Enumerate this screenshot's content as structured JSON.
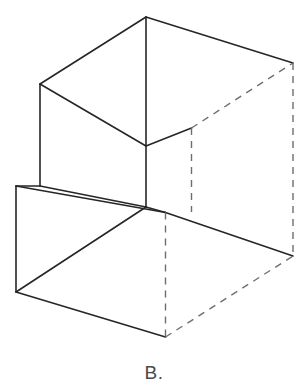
{
  "figure": {
    "caption": "B.",
    "label_letter": "B",
    "type": "isometric-wireframe",
    "canvas": {
      "width": 308,
      "height": 392,
      "background": "#ffffff"
    },
    "style": {
      "visible_edge_color": "#262626",
      "hidden_edge_color": "#6e6e6e",
      "visible_edge_width": 1.6,
      "hidden_edge_width": 1.4,
      "hidden_dash_pattern": "7 6"
    },
    "vertices": {
      "top_apex": [
        146,
        17
      ],
      "top_left": [
        40,
        84
      ],
      "top_right": [
        293,
        63
      ],
      "upper_front_right": [
        191,
        128
      ],
      "upper_front_center": [
        146,
        207
      ],
      "upper_left_lower": [
        40,
        186
      ],
      "lower_left_top": [
        16,
        186
      ],
      "lower_left_bottom": [
        16,
        292
      ],
      "lower_front_bottom": [
        165,
        337
      ],
      "lower_front_top": [
        165,
        212
      ],
      "lower_right_bottom": [
        293,
        256
      ],
      "step_left": [
        40,
        186
      ],
      "step_mid": [
        146,
        207
      ]
    },
    "edges_visible": [
      {
        "name": "top-face-left-back",
        "from": [
          146,
          17
        ],
        "to": [
          40,
          84
        ]
      },
      {
        "name": "top-face-right-back",
        "from": [
          146,
          17
        ],
        "to": [
          293,
          63
        ]
      },
      {
        "name": "top-face-front-left",
        "from": [
          40,
          84
        ],
        "to": [
          146,
          146
        ]
      },
      {
        "name": "top-face-front-right",
        "from": [
          146,
          146
        ],
        "to": [
          191,
          128
        ]
      },
      {
        "name": "center-vertical",
        "from": [
          146,
          17
        ],
        "to": [
          146,
          207
        ]
      },
      {
        "name": "upper-left-vertical",
        "from": [
          40,
          84
        ],
        "to": [
          40,
          186
        ]
      },
      {
        "name": "step-top-edge",
        "from": [
          40,
          186
        ],
        "to": [
          146,
          207
        ]
      },
      {
        "name": "step-front-edge",
        "from": [
          146,
          207
        ],
        "to": [
          165,
          212
        ]
      },
      {
        "name": "step-left-top",
        "from": [
          16,
          186
        ],
        "to": [
          40,
          186
        ]
      },
      {
        "name": "lower-top-left-edge",
        "from": [
          16,
          186
        ],
        "to": [
          165,
          212
        ]
      },
      {
        "name": "lower-top-right-edge",
        "from": [
          165,
          212
        ],
        "to": [
          293,
          256
        ]
      },
      {
        "name": "lower-left-vertical",
        "from": [
          16,
          186
        ],
        "to": [
          16,
          292
        ]
      },
      {
        "name": "lower-front-left-edge",
        "from": [
          16,
          292
        ],
        "to": [
          165,
          337
        ]
      },
      {
        "name": "lower-diagonal",
        "from": [
          16,
          292
        ],
        "to": [
          146,
          207
        ]
      },
      {
        "name": "right-top-ridge",
        "from": [
          293,
          63
        ],
        "to": [
          293,
          63
        ]
      }
    ],
    "edges_hidden": [
      {
        "name": "hidden-back-right-vertical",
        "from": [
          293,
          63
        ],
        "to": [
          293,
          256
        ]
      },
      {
        "name": "hidden-upper-right-diagonal",
        "from": [
          191,
          128
        ],
        "to": [
          293,
          63
        ]
      },
      {
        "name": "hidden-upper-right-vertical",
        "from": [
          191,
          128
        ],
        "to": [
          191,
          212
        ]
      },
      {
        "name": "hidden-lower-center-vertical",
        "from": [
          165,
          212
        ],
        "to": [
          165,
          337
        ]
      },
      {
        "name": "hidden-bottom-right-diagonal",
        "from": [
          165,
          337
        ],
        "to": [
          293,
          256
        ]
      }
    ]
  }
}
